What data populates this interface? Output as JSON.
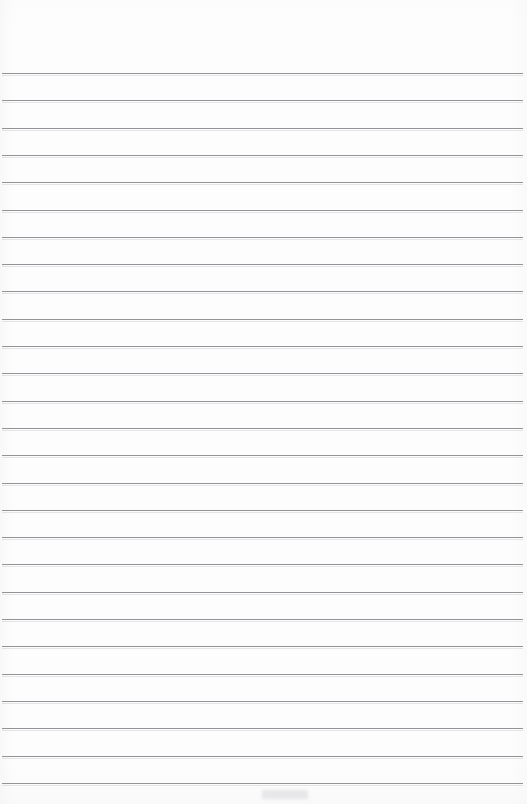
{
  "document": {
    "kind": "blank-lined-notepad-page",
    "page_label": "",
    "header_text": "",
    "body_text": "",
    "footer_text": ""
  },
  "page": {
    "width": 527,
    "height": 804,
    "background_color": "#fdfdfd",
    "paper_tone": "#fdfdfd"
  },
  "ruling": {
    "line_color": "#8c8c90",
    "line_thickness_px": 1,
    "line_count": 27,
    "first_line_y": 73,
    "last_line_y": 783,
    "line_spacing_px": 27.3,
    "line_left_x": 2,
    "line_right_x": 523,
    "top_margin_px": 73,
    "left_margin_px": 2,
    "right_margin_px": 4,
    "margin_rule_present": false,
    "lines_y": [
      73,
      100.3,
      127.6,
      154.9,
      182.2,
      209.5,
      236.8,
      264.1,
      291.4,
      318.7,
      346,
      373.3,
      400.6,
      427.9,
      455.2,
      482.5,
      509.8,
      537.1,
      564.4,
      591.7,
      619,
      646.3,
      673.6,
      700.9,
      728.2,
      755.5,
      782.8
    ]
  },
  "content": {
    "has_handwriting": false,
    "has_printed_text": false,
    "has_images": false,
    "notes": ""
  }
}
